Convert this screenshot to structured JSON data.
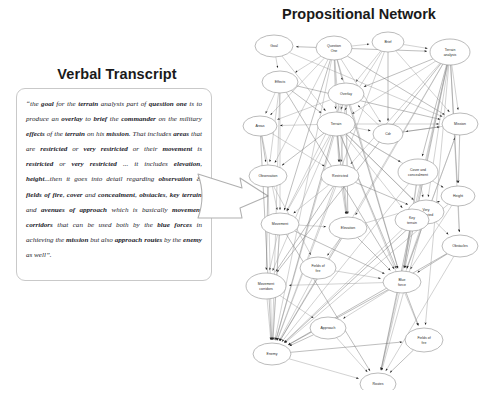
{
  "transcript": {
    "title": "Verbal Transcript",
    "body": "“the goal for the terrain analysis part of question one is to produce an overlay to brief the commander on the military effects of the terrain on his mission. That includes areas that are restricted or very restricted or their movement is restricted or very restricted ... it includes elevation, height...then it goes into detail regarding observation & fields of fire, cover and concealment, obstacles, key terrain and avenues of approach which is basically movement corridors that can be used both by the blue forces in achieving the mission but also approach routes by the enemy as well”.",
    "emphasized_terms": [
      "goal",
      "terrain",
      "question one",
      "overlay",
      "brief",
      "commander",
      "effects",
      "terrain",
      "mission",
      "areas",
      "restricted",
      "very restricted",
      "movement",
      "restricted",
      "very restricted",
      "elevation",
      "height",
      "observation",
      "fields of fire",
      "cover",
      "concealment",
      "obstacles",
      "key terrain",
      "avenues of",
      "approach",
      "movement corridors",
      "blue forces",
      "mission",
      "routes",
      "enemy"
    ]
  },
  "flow_arrow": {
    "icon": "right-arrow-icon",
    "direction": "right"
  },
  "network": {
    "title": "Propositional Network",
    "nodes": [
      {
        "id": "goal",
        "label": "Goal",
        "x": 38,
        "y": 22,
        "rx": 19,
        "ry": 11
      },
      {
        "id": "question-one",
        "label": "Question One",
        "x": 98,
        "y": 24,
        "rx": 18,
        "ry": 12
      },
      {
        "id": "brief",
        "label": "Brief",
        "x": 152,
        "y": 18,
        "rx": 16,
        "ry": 10
      },
      {
        "id": "terrain-analysis",
        "label": "Terrain analysis",
        "x": 214,
        "y": 28,
        "rx": 20,
        "ry": 13
      },
      {
        "id": "effects",
        "label": "Effects",
        "x": 44,
        "y": 58,
        "rx": 18,
        "ry": 11
      },
      {
        "id": "overlay",
        "label": "Overlay",
        "x": 110,
        "y": 70,
        "rx": 18,
        "ry": 11
      },
      {
        "id": "areas",
        "label": "Areas",
        "x": 24,
        "y": 102,
        "rx": 17,
        "ry": 10
      },
      {
        "id": "terrain",
        "label": "Terrain",
        "x": 100,
        "y": 100,
        "rx": 19,
        "ry": 12
      },
      {
        "id": "cdr",
        "label": "Cdr",
        "x": 152,
        "y": 110,
        "rx": 15,
        "ry": 10
      },
      {
        "id": "mission",
        "label": "Mission",
        "x": 224,
        "y": 100,
        "rx": 18,
        "ry": 11
      },
      {
        "id": "observation",
        "label": "Observation",
        "x": 32,
        "y": 152,
        "rx": 19,
        "ry": 11
      },
      {
        "id": "restricted",
        "label": "Restricted",
        "x": 104,
        "y": 152,
        "rx": 19,
        "ry": 11
      },
      {
        "id": "cover-concealment",
        "label": "Cover and concealment",
        "x": 182,
        "y": 148,
        "rx": 20,
        "ry": 13
      },
      {
        "id": "height",
        "label": "Height",
        "x": 222,
        "y": 172,
        "rx": 17,
        "ry": 10
      },
      {
        "id": "very-restricted",
        "label": "Very restricted",
        "x": 190,
        "y": 188,
        "rx": 18,
        "ry": 12
      },
      {
        "id": "movement",
        "label": "Movement",
        "x": 44,
        "y": 200,
        "rx": 19,
        "ry": 11
      },
      {
        "id": "elevation",
        "label": "Elevation",
        "x": 112,
        "y": 204,
        "rx": 19,
        "ry": 11
      },
      {
        "id": "obstacles",
        "label": "Obstacles",
        "x": 224,
        "y": 222,
        "rx": 18,
        "ry": 11
      },
      {
        "id": "key-terrain",
        "label": "Key terrain",
        "x": 176,
        "y": 196,
        "rx": 17,
        "ry": 11
      },
      {
        "id": "fields-fire-mid",
        "label": "Fields of fire",
        "x": 82,
        "y": 244,
        "rx": 18,
        "ry": 11
      },
      {
        "id": "movement-corridors",
        "label": "Movement corridors",
        "x": 30,
        "y": 262,
        "rx": 20,
        "ry": 13
      },
      {
        "id": "blue-force",
        "label": "Blue force",
        "x": 166,
        "y": 258,
        "rx": 19,
        "ry": 11
      },
      {
        "id": "approach",
        "label": "Approach",
        "x": 92,
        "y": 304,
        "rx": 18,
        "ry": 11
      },
      {
        "id": "enemy",
        "label": "Enemy",
        "x": 36,
        "y": 330,
        "rx": 19,
        "ry": 11
      },
      {
        "id": "fields-of-fire",
        "label": "Fields of fire",
        "x": 188,
        "y": 316,
        "rx": 19,
        "ry": 12
      },
      {
        "id": "routes",
        "label": "Routes",
        "x": 142,
        "y": 360,
        "rx": 18,
        "ry": 11
      }
    ],
    "edges": [
      [
        "question-one",
        "goal"
      ],
      [
        "question-one",
        "brief"
      ],
      [
        "question-one",
        "effects"
      ],
      [
        "question-one",
        "overlay"
      ],
      [
        "question-one",
        "terrain"
      ],
      [
        "question-one",
        "areas"
      ],
      [
        "question-one",
        "terrain-analysis"
      ],
      [
        "question-one",
        "restricted"
      ],
      [
        "question-one",
        "observation"
      ],
      [
        "question-one",
        "movement"
      ],
      [
        "question-one",
        "elevation"
      ],
      [
        "question-one",
        "cdr"
      ],
      [
        "question-one",
        "mission"
      ],
      [
        "goal",
        "effects"
      ],
      [
        "effects",
        "areas"
      ],
      [
        "effects",
        "terrain"
      ],
      [
        "effects",
        "observation"
      ],
      [
        "effects",
        "movement"
      ],
      [
        "effects",
        "mission"
      ],
      [
        "brief",
        "terrain-analysis"
      ],
      [
        "brief",
        "overlay"
      ],
      [
        "brief",
        "cdr"
      ],
      [
        "brief",
        "terrain"
      ],
      [
        "brief",
        "mission"
      ],
      [
        "terrain-analysis",
        "overlay"
      ],
      [
        "terrain-analysis",
        "terrain"
      ],
      [
        "terrain-analysis",
        "mission"
      ],
      [
        "terrain-analysis",
        "height"
      ],
      [
        "terrain-analysis",
        "obstacles"
      ],
      [
        "terrain-analysis",
        "very-restricted"
      ],
      [
        "terrain-analysis",
        "cover-concealment"
      ],
      [
        "terrain-analysis",
        "key-terrain"
      ],
      [
        "terrain-analysis",
        "elevation"
      ],
      [
        "terrain-analysis",
        "blue-force"
      ],
      [
        "terrain-analysis",
        "enemy"
      ],
      [
        "terrain-analysis",
        "restricted"
      ],
      [
        "overlay",
        "terrain"
      ],
      [
        "overlay",
        "areas"
      ],
      [
        "overlay",
        "restricted"
      ],
      [
        "overlay",
        "elevation"
      ],
      [
        "overlay",
        "movement"
      ],
      [
        "terrain",
        "areas"
      ],
      [
        "terrain",
        "observation"
      ],
      [
        "terrain",
        "restricted"
      ],
      [
        "terrain",
        "movement"
      ],
      [
        "terrain",
        "elevation"
      ],
      [
        "terrain",
        "height"
      ],
      [
        "terrain",
        "cover-concealment"
      ],
      [
        "terrain",
        "very-restricted"
      ],
      [
        "terrain",
        "key-terrain"
      ],
      [
        "terrain",
        "obstacles"
      ],
      [
        "terrain",
        "blue-force"
      ],
      [
        "terrain",
        "movement-corridors"
      ],
      [
        "terrain",
        "fields-of-fire"
      ],
      [
        "terrain",
        "enemy"
      ],
      [
        "terrain",
        "cdr"
      ],
      [
        "terrain",
        "mission"
      ],
      [
        "areas",
        "observation"
      ],
      [
        "areas",
        "restricted"
      ],
      [
        "areas",
        "movement"
      ],
      [
        "restricted",
        "very-restricted"
      ],
      [
        "restricted",
        "movement"
      ],
      [
        "restricted",
        "elevation"
      ],
      [
        "restricted",
        "movement-corridors"
      ],
      [
        "movement",
        "movement-corridors"
      ],
      [
        "movement",
        "elevation"
      ],
      [
        "movement",
        "blue-force"
      ],
      [
        "movement",
        "enemy"
      ],
      [
        "elevation",
        "height"
      ],
      [
        "elevation",
        "blue-force"
      ],
      [
        "elevation",
        "fields-fire-mid"
      ],
      [
        "observation",
        "fields-fire-mid"
      ],
      [
        "observation",
        "movement-corridors"
      ],
      [
        "cover-concealment",
        "very-restricted"
      ],
      [
        "cover-concealment",
        "key-terrain"
      ],
      [
        "key-terrain",
        "blue-force"
      ],
      [
        "very-restricted",
        "blue-force"
      ],
      [
        "height",
        "obstacles"
      ],
      [
        "obstacles",
        "blue-force"
      ],
      [
        "blue-force",
        "movement-corridors"
      ],
      [
        "blue-force",
        "routes"
      ],
      [
        "blue-force",
        "fields-of-fire"
      ],
      [
        "blue-force",
        "approach"
      ],
      [
        "blue-force",
        "mission"
      ],
      [
        "blue-force",
        "enemy"
      ],
      [
        "movement-corridors",
        "enemy"
      ],
      [
        "movement-corridors",
        "approach"
      ],
      [
        "approach",
        "enemy"
      ],
      [
        "approach",
        "routes"
      ],
      [
        "enemy",
        "routes"
      ],
      [
        "enemy",
        "fields-of-fire"
      ],
      [
        "fields-fire-mid",
        "blue-force"
      ],
      [
        "fields-fire-mid",
        "enemy"
      ],
      [
        "mission",
        "height"
      ],
      [
        "mission",
        "cdr"
      ],
      [
        "mission",
        "blue-force"
      ],
      [
        "cdr",
        "mission"
      ],
      [
        "cdr",
        "overlay"
      ],
      [
        "height",
        "blue-force"
      ],
      [
        "very-restricted",
        "enemy"
      ],
      [
        "key-terrain",
        "enemy"
      ],
      [
        "cover-concealment",
        "blue-force"
      ],
      [
        "obstacles",
        "enemy"
      ],
      [
        "goal",
        "terrain"
      ],
      [
        "goal",
        "mission"
      ],
      [
        "elevation",
        "enemy"
      ],
      [
        "restricted",
        "enemy"
      ],
      [
        "observation",
        "enemy"
      ],
      [
        "areas",
        "enemy"
      ],
      [
        "terrain-analysis",
        "fields-of-fire"
      ],
      [
        "terrain-analysis",
        "routes"
      ],
      [
        "terrain-analysis",
        "movement-corridors"
      ],
      [
        "question-one",
        "blue-force"
      ],
      [
        "question-one",
        "enemy"
      ],
      [
        "overlay",
        "blue-force"
      ],
      [
        "overlay",
        "enemy"
      ],
      [
        "effects",
        "enemy"
      ],
      [
        "effects",
        "blue-force"
      ],
      [
        "brief",
        "enemy"
      ],
      [
        "height",
        "enemy"
      ],
      [
        "fields-of-fire",
        "routes"
      ],
      [
        "obstacles",
        "routes"
      ],
      [
        "very-restricted",
        "routes"
      ],
      [
        "key-terrain",
        "routes"
      ],
      [
        "cover-concealment",
        "enemy"
      ],
      [
        "movement",
        "enemy"
      ],
      [
        "movement",
        "routes"
      ]
    ]
  }
}
